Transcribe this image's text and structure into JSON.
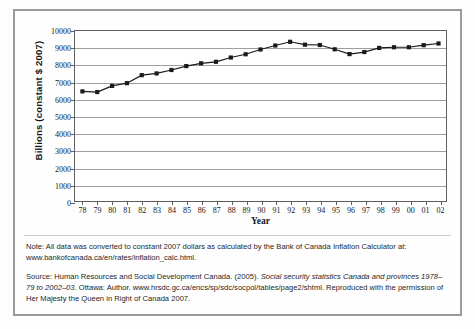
{
  "chart_data": {
    "type": "line",
    "title": "",
    "xlabel": "Year",
    "ylabel": "Billions (constant $ 2007)",
    "xlim": [
      1978,
      2002
    ],
    "ylim": [
      0,
      10000
    ],
    "yticks": [
      0,
      1000,
      2000,
      3000,
      4000,
      5000,
      6000,
      7000,
      8000,
      9000,
      10000
    ],
    "ytick_labels": [
      "0",
      "1000",
      "2000",
      "3000",
      "4000",
      "5000",
      "6000",
      "7000",
      "8000",
      "9000",
      "10000"
    ],
    "grid": true,
    "legend": "none",
    "marker": "square",
    "line_color": "#1a1a1a",
    "marker_color": "#1a1a1a",
    "categories": [
      "78",
      "79",
      "80",
      "81",
      "82",
      "83",
      "84",
      "85",
      "86",
      "87",
      "88",
      "89",
      "90",
      "91",
      "92",
      "93",
      "94",
      "95",
      "96",
      "97",
      "98",
      "99",
      "00",
      "01",
      "02"
    ],
    "values": [
      6470,
      6430,
      6790,
      6950,
      7420,
      7520,
      7720,
      7950,
      8110,
      8200,
      8450,
      8640,
      8920,
      9150,
      9370,
      9200,
      9180,
      8930,
      8650,
      8770,
      9010,
      9050,
      9050,
      9170,
      9270
    ]
  },
  "figure": {
    "axis": {
      "x_title": "Year",
      "y_title": "Billions (constant $ 2007)"
    },
    "note": {
      "line1": "Note: All data was converted to constant 2007 dollars as calculated by the Bank of Canada Inflation Calculator",
      "line2": "at: www.bankofcanada.ca/en/rates/inflation_calc.html."
    },
    "source": {
      "seg1": "Source: Human Resources and Social Development Canada. (2005). ",
      "seg2_italic": "Social security statistics Canada and provinces 1978–79 to 2002–03",
      "seg3": ". Ottawa: Author. www.hrsdc.gc.ca/encs/sp/sdc/socpol/tables/page2/shtml. Reproduced with the permission of Her Majesty the Queen in Right of Canada 2007."
    }
  }
}
